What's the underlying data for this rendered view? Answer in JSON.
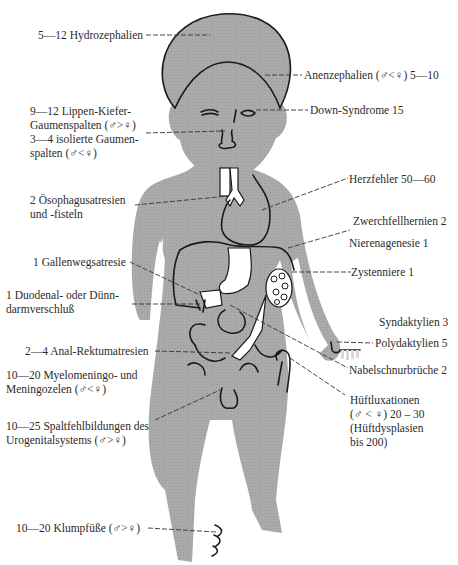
{
  "figure": {
    "body_color": "#a9a9a9",
    "line_color": "#333333"
  },
  "labels": {
    "hydrocephalus": "5—12 Hydrozephalien",
    "anencephaly": "Anenzephalien (♂<♀) 5—10",
    "down_syndrome": "Down-Syndrome 15",
    "cleft": [
      "9—12 Lippen-Kiefer-",
      "Gaumenspalten (♂>♀)",
      "3—4 isolierte Gaumen-",
      "spalten (♂<♀)"
    ],
    "esophageal": [
      "2 Ösophagusatresien",
      "und -fisteln"
    ],
    "heart": "Herzfehler 50—60",
    "diaphragm": "Zwerchfellhernien 2",
    "renal_agenesis": "Nierenagenesie 1",
    "cystic_kidney": "Zystenniere 1",
    "biliary": "1 Gallenwegsatresie",
    "duodenal": [
      "1 Duodenal- oder Dünn-",
      "darmverschluß"
    ],
    "syndactyly": "Syndaktylien 3",
    "polydactyly": "Polydaktylien 5",
    "anal": "2—4 Anal-Rektumatresien",
    "omphalocele": "Nabelschnurbrüche 2",
    "myelo": [
      "10—20 Myelomeningo- und",
      "Meningozelen (♂<♀)"
    ],
    "hip": [
      "Hüftluxationen",
      "(♂ < ♀) 20 – 30",
      "(Hüftdysplasien",
      "bis 200)"
    ],
    "urogenital": [
      "10—25 Spaltfehlbildungen des",
      "Urogenitalsystems (♂>♀)"
    ],
    "clubfoot": "10—20 Klumpfüße (♂>♀)"
  }
}
